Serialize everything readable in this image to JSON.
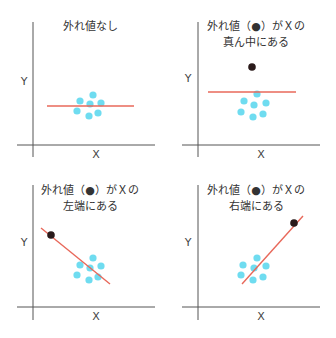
{
  "colors": {
    "axis": "#555555",
    "fit_line": "#e8685a",
    "normal_point": "#6fdcf0",
    "outlier_point": "#2a1a1a",
    "text": "#333333"
  },
  "panels": [
    {
      "id": "no-outlier",
      "title_lines": [
        "外れ値なし"
      ],
      "xlabel": "X",
      "ylabel": "Y",
      "axis_origin": [
        33,
        145
      ],
      "axis_v": [
        33,
        22,
        33,
        157
      ],
      "axis_h": [
        17,
        145,
        155,
        145
      ],
      "title_pos": [
        90,
        30
      ],
      "ylabel_pos": [
        24,
        85
      ],
      "xlabel_pos": [
        96,
        158
      ],
      "fit_line": [
        47,
        106,
        134,
        106
      ],
      "points": [
        [
          93,
          95
        ],
        [
          80,
          101
        ],
        [
          101,
          103
        ],
        [
          90,
          104
        ],
        [
          77,
          111
        ],
        [
          98,
          113
        ],
        [
          89,
          116
        ]
      ],
      "outlier": null
    },
    {
      "id": "outlier-middle",
      "title_lines": [
        "外れ値（●）がＸの",
        "真ん中にある"
      ],
      "xlabel": "X",
      "ylabel": "Y",
      "axis_v": [
        198,
        22,
        198,
        157
      ],
      "axis_h": [
        182,
        145,
        320,
        145
      ],
      "title_pos": [
        256,
        30
      ],
      "ylabel_pos": [
        188,
        82
      ],
      "xlabel_pos": [
        261,
        158
      ],
      "fit_line": [
        208,
        92,
        296,
        92
      ],
      "points": [
        [
          257,
          94
        ],
        [
          244,
          101
        ],
        [
          266,
          103
        ],
        [
          254,
          105
        ],
        [
          241,
          112
        ],
        [
          263,
          114
        ],
        [
          253,
          117
        ]
      ],
      "outlier": [
        252,
        67
      ]
    },
    {
      "id": "outlier-left",
      "title_lines": [
        "外れ値（●）がＸの",
        "左端にある"
      ],
      "xlabel": "X",
      "ylabel": "Y",
      "axis_v": [
        33,
        185,
        33,
        320
      ],
      "axis_h": [
        17,
        307,
        155,
        307
      ],
      "title_pos": [
        90,
        194
      ],
      "ylabel_pos": [
        24,
        246
      ],
      "xlabel_pos": [
        96,
        320
      ],
      "fit_line": [
        41,
        228,
        110,
        284
      ],
      "points": [
        [
          93,
          258
        ],
        [
          80,
          265
        ],
        [
          101,
          266
        ],
        [
          90,
          268
        ],
        [
          77,
          275
        ],
        [
          98,
          277
        ],
        [
          89,
          280
        ]
      ],
      "outlier": [
        51,
        235
      ]
    },
    {
      "id": "outlier-right",
      "title_lines": [
        "外れ値（●）がＸの",
        "右端にある"
      ],
      "xlabel": "X",
      "ylabel": "Y",
      "axis_v": [
        198,
        185,
        198,
        320
      ],
      "axis_h": [
        182,
        307,
        320,
        307
      ],
      "title_pos": [
        256,
        194
      ],
      "ylabel_pos": [
        188,
        246
      ],
      "xlabel_pos": [
        261,
        320
      ],
      "fit_line": [
        242,
        284,
        303,
        216
      ],
      "points": [
        [
          257,
          258
        ],
        [
          243,
          265
        ],
        [
          266,
          266
        ],
        [
          254,
          268
        ],
        [
          241,
          275
        ],
        [
          263,
          277
        ],
        [
          253,
          280
        ]
      ],
      "outlier": [
        294,
        223
      ]
    }
  ]
}
